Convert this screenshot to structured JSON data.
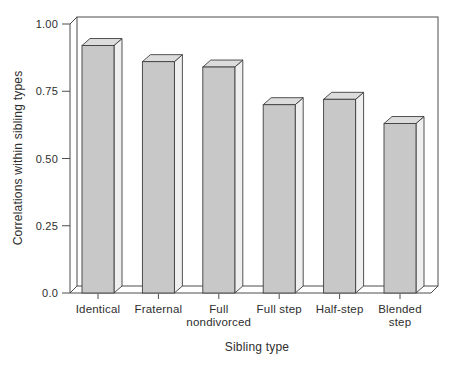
{
  "figure": {
    "background": "#ffffff"
  },
  "chart_data": {
    "type": "bar",
    "style": "3d-block-bars",
    "title": "",
    "xlabel": "Sibling type",
    "ylabel": "Correlations within sibling types",
    "categories": [
      "Identical",
      "Fraternal",
      "Full nondivorced",
      "Full step",
      "Half-step",
      "Blended step"
    ],
    "category_label_lines": [
      [
        "Identical"
      ],
      [
        "Fraternal"
      ],
      [
        "Full",
        "nondivorced"
      ],
      [
        "Full step"
      ],
      [
        "Half-step"
      ],
      [
        "Blended",
        "step"
      ]
    ],
    "values": [
      0.92,
      0.86,
      0.84,
      0.7,
      0.72,
      0.63
    ],
    "ylim": [
      0,
      1.0
    ],
    "yticks": [
      0,
      0.25,
      0.5,
      0.75,
      1.0
    ],
    "ytick_labels": [
      "0.0",
      "0.25",
      "0.50",
      "0.75",
      "1.00"
    ],
    "grid": false,
    "legend": null,
    "colors": {
      "bar_front": "#c8c8c8",
      "bar_top": "#dcdcdc",
      "bar_side": "#efefef",
      "outline": "#3f3f3f",
      "axis": "#4d4d4d",
      "text": "#2e2e2e"
    }
  }
}
